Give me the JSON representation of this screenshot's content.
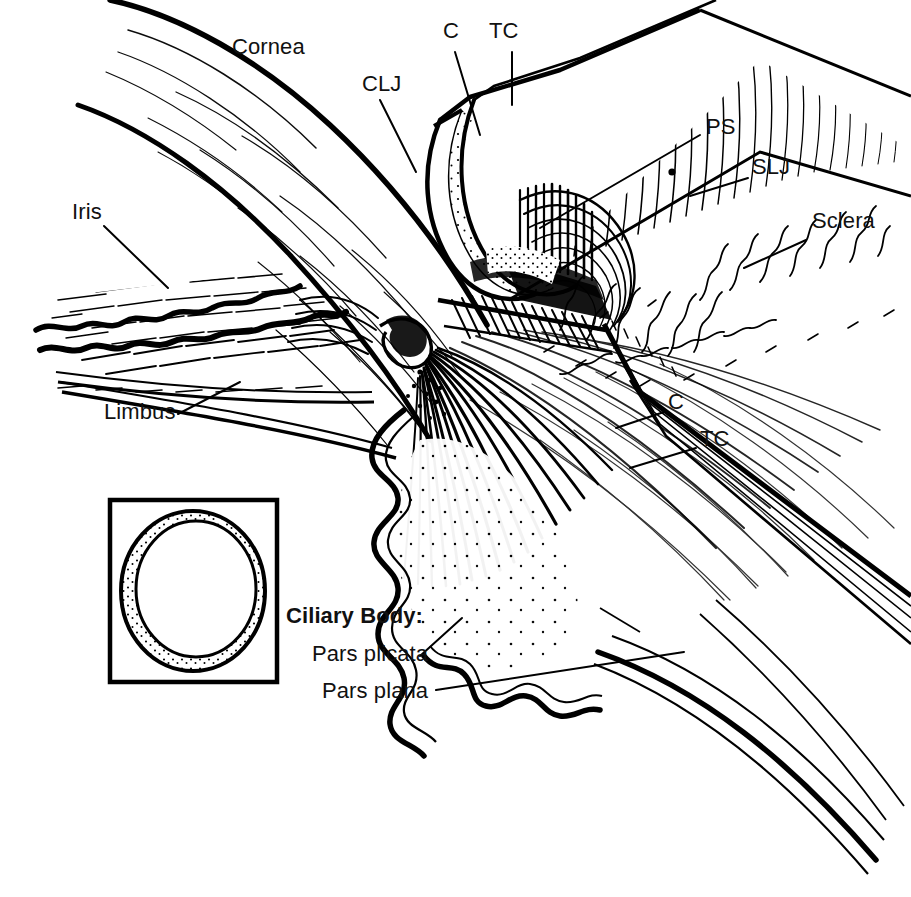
{
  "figure": {
    "kind": "anatomical-line-drawing",
    "style": "black-and-white pen-and-ink cutaway illustration with hatching and stippling",
    "background_color": "#ffffff",
    "ink_color": "#000000",
    "width": 911,
    "height": 897
  },
  "labels": [
    {
      "id": "cornea",
      "text": "Cornea",
      "x": 232,
      "y": 48,
      "bold": false,
      "leader": false
    },
    {
      "id": "clj",
      "text": "CLJ",
      "x": 362,
      "y": 85,
      "bold": false,
      "leader": true
    },
    {
      "id": "c-top",
      "text": "C",
      "x": 443,
      "y": 32,
      "bold": false,
      "leader": true
    },
    {
      "id": "tc-top",
      "text": "TC",
      "x": 489,
      "y": 32,
      "bold": false,
      "leader": true
    },
    {
      "id": "ps",
      "text": "PS",
      "x": 706,
      "y": 128,
      "bold": false,
      "leader": true
    },
    {
      "id": "slj",
      "text": "SLJ",
      "x": 752,
      "y": 168,
      "bold": false,
      "leader": true
    },
    {
      "id": "sclera",
      "text": "Sclera",
      "x": 812,
      "y": 222,
      "bold": false,
      "leader": true
    },
    {
      "id": "iris",
      "text": "Iris",
      "x": 72,
      "y": 213,
      "bold": false,
      "leader": true
    },
    {
      "id": "limbus",
      "text": "Limbus",
      "x": 104,
      "y": 413,
      "bold": false,
      "leader": true
    },
    {
      "id": "c-bottom",
      "text": "C",
      "x": 668,
      "y": 403,
      "bold": false,
      "leader": true
    },
    {
      "id": "tc-bottom",
      "text": "TC",
      "x": 700,
      "y": 440,
      "bold": false,
      "leader": true
    },
    {
      "id": "ciliary-body",
      "text": "Ciliary Body:",
      "x": 286,
      "y": 617,
      "bold": true,
      "leader": false
    },
    {
      "id": "pars-plicata",
      "text": "Pars plicata",
      "x": 312,
      "y": 655,
      "bold": false,
      "leader": true
    },
    {
      "id": "pars-plana",
      "text": "Pars plana",
      "x": 322,
      "y": 692,
      "bold": false,
      "leader": true
    }
  ],
  "abbreviations": {
    "CLJ": "CLJ",
    "C": "C",
    "TC": "TC",
    "PS": "PS",
    "SLJ": "SLJ"
  },
  "inset": {
    "id": "cross-section-inset",
    "description": "square boxed cross-section of the globe showing a stippled annular ring",
    "box": {
      "x": 110,
      "y": 500,
      "w": 167,
      "h": 182
    },
    "ring": {
      "cx": 193,
      "cy": 591,
      "outer_rx": 72,
      "outer_ry": 80,
      "inner_rx": 60,
      "inner_ry": 68
    },
    "fill": "stipple"
  },
  "regions": [
    {
      "id": "cornea-region",
      "name": "Cornea"
    },
    {
      "id": "limbus-region",
      "name": "Limbus"
    },
    {
      "id": "iris-region",
      "name": "Iris"
    },
    {
      "id": "sclera-region",
      "name": "Sclera"
    },
    {
      "id": "trabecular-meshwork",
      "name": "TC"
    },
    {
      "id": "schlemms-canal",
      "name": "C"
    },
    {
      "id": "scleral-spur",
      "name": "PS"
    },
    {
      "id": "scleral-limbal-junction",
      "name": "SLJ"
    },
    {
      "id": "corneo-limbal-junction",
      "name": "CLJ"
    },
    {
      "id": "ciliary-muscle-fan",
      "name": "Ciliary Body"
    },
    {
      "id": "pars-plicata-region",
      "name": "Pars plicata"
    },
    {
      "id": "pars-plana-region",
      "name": "Pars plana"
    }
  ]
}
